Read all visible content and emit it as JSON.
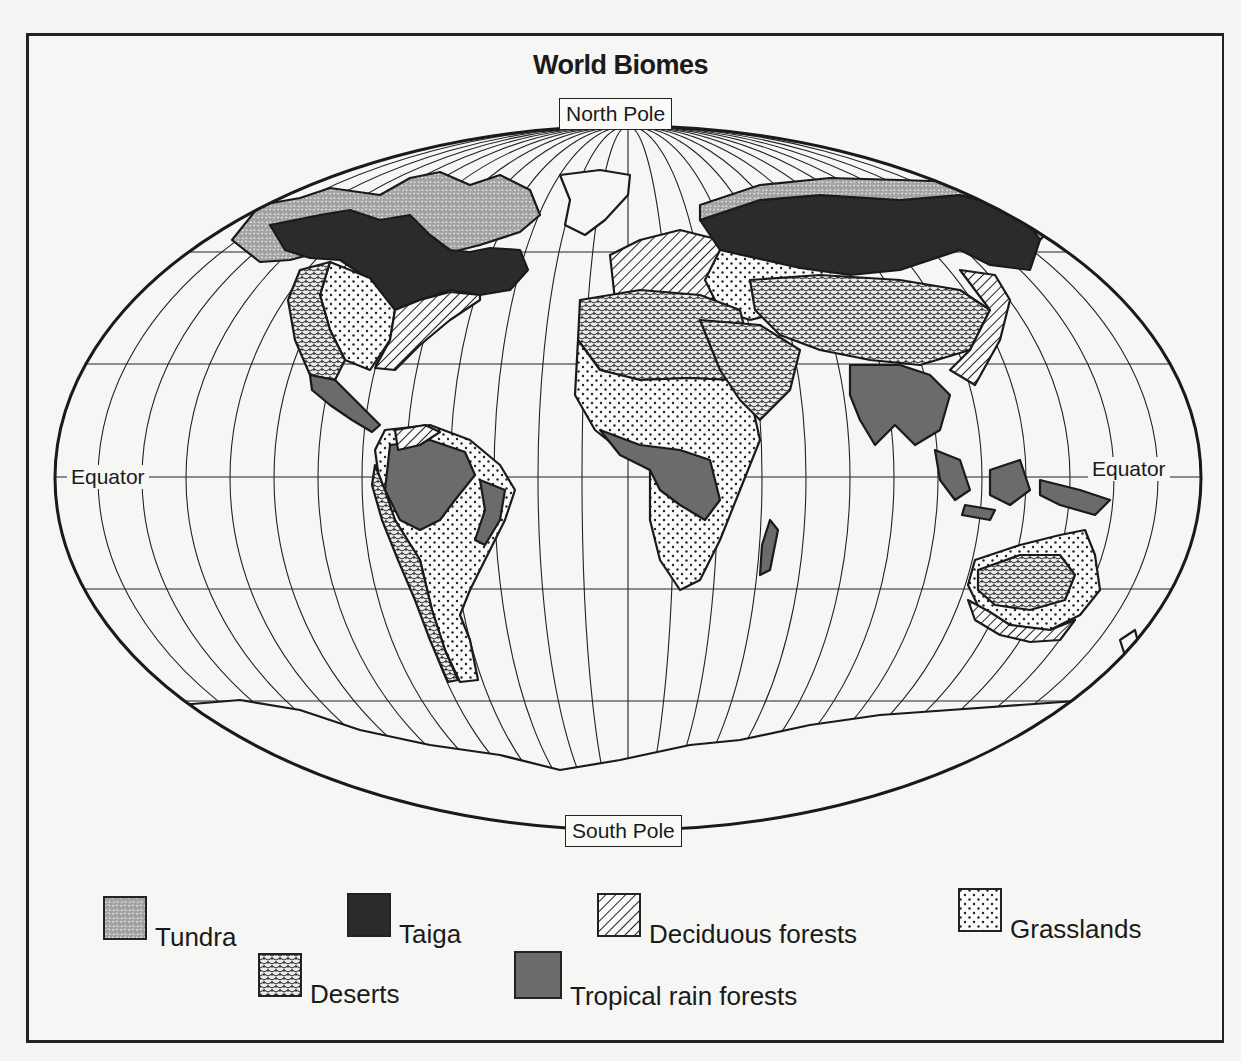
{
  "title": "World Biomes",
  "labels": {
    "north_pole": "North Pole",
    "south_pole": "South Pole",
    "equator_left": "Equator",
    "equator_right": "Equator"
  },
  "legend": [
    {
      "key": "tundra",
      "label": "Tundra",
      "pattern": "tundra-pattern"
    },
    {
      "key": "taiga",
      "label": "Taiga",
      "pattern": "taiga-fill"
    },
    {
      "key": "deciduous",
      "label": "Deciduous forests",
      "pattern": "hatch-pattern"
    },
    {
      "key": "grasslands",
      "label": "Grasslands",
      "pattern": "dot-pattern"
    },
    {
      "key": "deserts",
      "label": "Deserts",
      "pattern": "desert-pattern"
    },
    {
      "key": "tropical",
      "label": "Tropical rain forests",
      "pattern": "tropical-fill"
    }
  ],
  "colors": {
    "taiga": "#2b2b2b",
    "tropical": "#6b6b6b",
    "tundra_base": "#a8a8a8",
    "outline": "#1a1a1a",
    "paper": "#f6f6f4"
  }
}
